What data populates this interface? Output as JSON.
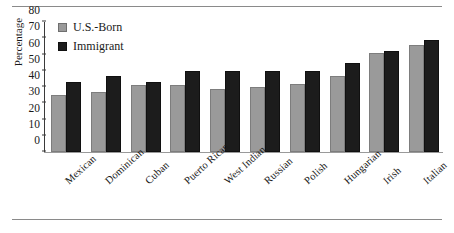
{
  "figure": {
    "has_top_rule": true,
    "has_bottom_rule": true
  },
  "legend": {
    "position": "top-left-inside",
    "entries": [
      {
        "label": "U.S.-Born",
        "color": "#9a9a9a",
        "swatch": "usb"
      },
      {
        "label": "Immigrant",
        "color": "#1c1c1c",
        "swatch": "imm"
      }
    ]
  },
  "chart_data": {
    "type": "bar",
    "title": "",
    "subtitle": "",
    "xlabel": "",
    "ylabel": "Percentage",
    "ylim": [
      0,
      80
    ],
    "ytick_values": [
      0,
      10,
      20,
      30,
      40,
      50,
      60,
      70,
      80
    ],
    "ytick_labels": [
      "0",
      "10",
      "20",
      "30",
      "40",
      "50",
      "60",
      "70",
      "80"
    ],
    "grid": false,
    "legend_position": "upper left",
    "categories": [
      "Mexican",
      "Dominican",
      "Cuban",
      "Puerto Rican",
      "West Indian",
      "Russian",
      "Polish",
      "Hungarian",
      "Irish",
      "Italian"
    ],
    "series": [
      {
        "name": "U.S.-Born",
        "color": "#9a9a9a",
        "values": [
          35,
          37,
          41,
          41,
          39,
          40,
          42,
          47,
          61,
          66
        ]
      },
      {
        "name": "Immigrant",
        "color": "#1c1c1c",
        "values": [
          43,
          47,
          43,
          50,
          50,
          50,
          50,
          55,
          62,
          69
        ]
      }
    ]
  }
}
